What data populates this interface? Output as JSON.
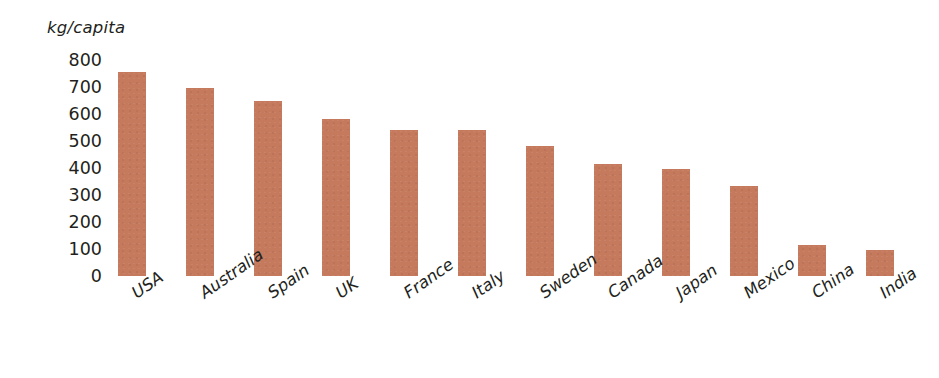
{
  "chart_data": {
    "type": "bar",
    "title": "",
    "subtitle": "",
    "xlabel": "",
    "ylabel": "kg/capita",
    "unit_caption": "kg/capita",
    "categories": [
      "USA",
      "Australia",
      "Spain",
      "UK",
      "France",
      "Italy",
      "Sweden",
      "Canada",
      "Japan",
      "Mexico",
      "China",
      "India"
    ],
    "values": [
      755,
      695,
      650,
      580,
      540,
      540,
      480,
      415,
      395,
      335,
      115,
      95
    ],
    "ylim": [
      0,
      800
    ],
    "ytick_labels": [
      "800",
      "700",
      "600",
      "500",
      "400",
      "300",
      "200",
      "100",
      "0"
    ],
    "ytick_values": [
      800,
      700,
      600,
      500,
      400,
      300,
      200,
      100,
      0
    ],
    "grid": false,
    "legend": null,
    "legend_position": "none",
    "bar_color": "#c57a5d",
    "text_color": "#231f20",
    "background_color": "#ffffff",
    "xtick_rotation_degrees": -35,
    "annotations": []
  }
}
